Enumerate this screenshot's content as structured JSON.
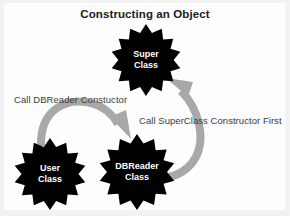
{
  "diagram": {
    "title": "Constructing an Object",
    "background_color": "#fdfdfd",
    "node_color": "#000000",
    "node_text_color": "#ffffff",
    "arrow_color": "#a8a8a8",
    "label_text_color": "#3c3c3c",
    "nodes": [
      {
        "id": "super-class",
        "shape": "starburst",
        "line1": "Super",
        "line2": "Class"
      },
      {
        "id": "user-class",
        "shape": "starburst",
        "line1": "User",
        "line2": "Class"
      },
      {
        "id": "dbreader-class",
        "shape": "starburst",
        "line1": "DBReader",
        "line2": "Class"
      }
    ],
    "arrows": [
      {
        "id": "user-to-dbreader",
        "from": "user-class",
        "to": "dbreader-class",
        "label": "Call DBReader Constuctor"
      },
      {
        "id": "dbreader-to-super",
        "from": "dbreader-class",
        "to": "super-class",
        "label": "Call SuperClass Constructor First"
      }
    ]
  }
}
